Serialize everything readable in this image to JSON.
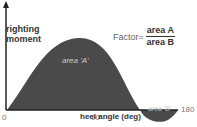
{
  "diagram": {
    "y_axis_label_line1": "righting",
    "y_axis_label_line2": "moment",
    "x_axis_label": "heel angle (deg)",
    "ticks": [
      "0",
      "90",
      "180"
    ],
    "area_a_label": "area 'A'",
    "area_b_label": "area 'B'",
    "formula": {
      "prefix": "Factor=",
      "numerator": "area A",
      "denominator": "area B"
    },
    "colors": {
      "fill": "#4a4a4a",
      "axis": "#222222",
      "area_text": "#cccccc"
    }
  }
}
